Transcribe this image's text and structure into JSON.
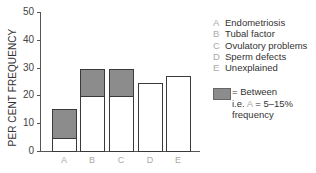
{
  "chart_data": {
    "type": "bar",
    "stacked_range": true,
    "title": "",
    "xlabel": "",
    "ylabel": "PER CENT FREQUENCY",
    "ylim": [
      0,
      50
    ],
    "yticks": [
      0,
      10,
      20,
      30,
      40,
      50
    ],
    "categories": [
      "A",
      "B",
      "C",
      "D",
      "E"
    ],
    "series": [
      {
        "name": "Lower bound (white)",
        "values": [
          5,
          20,
          20,
          24.5,
          27
        ]
      },
      {
        "name": "Upper bound (range, shaded)",
        "values": [
          15,
          29.5,
          29.5,
          24.5,
          27
        ]
      }
    ],
    "ranges": [
      {
        "category": "A",
        "low": 5,
        "high": 15
      },
      {
        "category": "B",
        "low": 20,
        "high": 29.5
      },
      {
        "category": "C",
        "low": 20,
        "high": 29.5
      },
      {
        "category": "D",
        "low": 24.5,
        "high": 24.5
      },
      {
        "category": "E",
        "low": 27,
        "high": 27
      }
    ],
    "legend": [
      {
        "key": "A",
        "label": "Endometriosis"
      },
      {
        "key": "B",
        "label": "Tubal factor"
      },
      {
        "key": "C",
        "label": "Ovulatory problems"
      },
      {
        "key": "D",
        "label": "Sperm defects"
      },
      {
        "key": "E",
        "label": "Unexplained"
      }
    ],
    "annotation": "= Between i.e. A = 5–15% frequency",
    "grid": false,
    "legend_position": "right"
  },
  "labels": {
    "ylabel": "PER CENT FREQUENCY",
    "yticks": [
      "0",
      "10",
      "20",
      "30",
      "40",
      "50"
    ],
    "xticks": [
      "A",
      "B",
      "C",
      "D",
      "E"
    ],
    "legend": [
      {
        "key": "A",
        "label": "Endometriosis"
      },
      {
        "key": "B",
        "label": "Tubal factor"
      },
      {
        "key": "C",
        "label": "Ovulatory problems"
      },
      {
        "key": "D",
        "label": "Sperm defects"
      },
      {
        "key": "E",
        "label": "Unexplained"
      }
    ],
    "note": {
      "line1": "= Between",
      "line2_pre": "i.e. ",
      "line2_key": "A",
      "line2_post": " = 5–15%",
      "line3": "frequency"
    }
  },
  "colors": {
    "shade": "#8c8c8c",
    "outline": "#3a3a3a",
    "tick_label_letters": "#aaaaaa"
  }
}
